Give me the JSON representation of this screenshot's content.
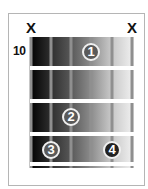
{
  "diagram": {
    "type": "guitar-chord-chart",
    "start_fret_label": "10",
    "strings": 6,
    "frets_shown": 4,
    "muted": [
      {
        "string": 6,
        "label": "X"
      },
      {
        "string": 1,
        "label": "X"
      }
    ],
    "fingers": [
      {
        "finger": "1",
        "string": 3,
        "fret": 1
      },
      {
        "finger": "2",
        "string": 4,
        "fret": 3
      },
      {
        "finger": "3",
        "string": 5,
        "fret": 4
      },
      {
        "finger": "4",
        "string": 2,
        "fret": 4
      }
    ],
    "colors": {
      "gradient_left": "#000000",
      "gradient_right": "#f2f2f2",
      "fret": "#ffffff",
      "string": "#8f8f8f",
      "finger_dot": "#5a5a5a",
      "finger_dot_dark": "#222222"
    }
  }
}
